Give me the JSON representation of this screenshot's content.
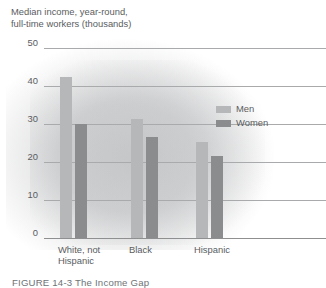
{
  "chart_data": {
    "type": "bar",
    "title": "Median income, year-round,\nfull-time workers (thousands)",
    "xlabel": "",
    "ylabel": "",
    "ylim": [
      0,
      50
    ],
    "yticks": [
      0,
      10,
      20,
      30,
      40,
      50
    ],
    "ytick_labels": [
      "0",
      "10",
      "20",
      "30",
      "40",
      "50"
    ],
    "grid": true,
    "legend_position": "upper right",
    "categories": [
      "White, not\nHispanic",
      "Black",
      "Hispanic"
    ],
    "series": [
      {
        "name": "Men",
        "color": "#b6b7b9",
        "values": [
          42.5,
          31.2,
          25.2
        ]
      },
      {
        "name": "Women",
        "color": "#8a8c8e",
        "values": [
          30.1,
          26.6,
          21.5
        ]
      }
    ]
  },
  "legend": {
    "items": [
      {
        "label": "Men",
        "color": "#b6b7b9"
      },
      {
        "label": "Women",
        "color": "#8a8c8e"
      }
    ]
  },
  "caption": {
    "text": "FIGURE 14-3  The Income Gap"
  },
  "colors": {
    "gridline": "#a9aaac",
    "axis": "#8d8f91",
    "text": "#5a5d61",
    "background": "#ffffff"
  }
}
